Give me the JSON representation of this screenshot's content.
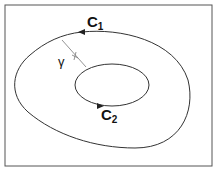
{
  "diagram": {
    "labels": {
      "outer_curve": "C",
      "outer_sub": "1",
      "inner_curve": "C",
      "inner_sub": "2",
      "cut": "γ"
    },
    "colors": {
      "stroke": "#333333",
      "frame": "#555555",
      "cut": "#777777",
      "background": "#ffffff"
    }
  }
}
